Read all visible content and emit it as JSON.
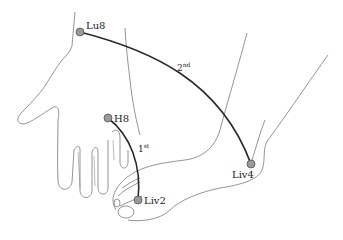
{
  "figure": {
    "points": [
      {
        "id": "Lu8",
        "label": "Lu8",
        "x": 80,
        "y": 32
      },
      {
        "id": "H8",
        "label": "H8",
        "x": 108,
        "y": 118
      },
      {
        "id": "Liv2",
        "label": "Liv2",
        "x": 138,
        "y": 200
      },
      {
        "id": "Liv4",
        "label": "Liv4",
        "x": 251,
        "y": 164
      }
    ],
    "connections": [
      {
        "from": "H8",
        "to": "Liv2",
        "order_label": "1",
        "order_suffix": "st"
      },
      {
        "from": "Lu8",
        "to": "Liv4",
        "order_label": "2",
        "order_suffix": "nd"
      }
    ],
    "colors": {
      "outline": "#777777",
      "arc": "#2a2a2a",
      "point_fill": "#9a9a9a",
      "point_stroke": "#555555"
    }
  }
}
